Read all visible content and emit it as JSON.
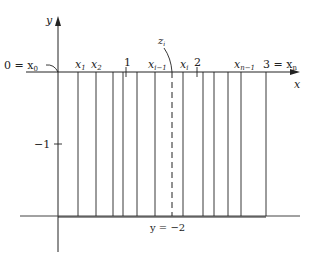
{
  "diagram": {
    "axes": {
      "x_label": "x",
      "y_label": "y"
    },
    "tick_labels": {
      "one": "1",
      "two": "2",
      "minus_one": "−1"
    },
    "partition_labels": {
      "x0": "0 = x",
      "x0_sub": "0",
      "x1": "x",
      "x1_sub": "1",
      "x2": "x",
      "x2_sub": "2",
      "xim1": "x",
      "xim1_sub": "i−1",
      "xi": "x",
      "xi_sub": "i",
      "xnm1": "x",
      "xnm1_sub": "n−1",
      "xn": "3 = x",
      "xn_sub": "n"
    },
    "sample_point": {
      "label": "z",
      "sub": "i"
    },
    "bottom_line_label": "y = −2",
    "partition_x_px": [
      58,
      78,
      96,
      113,
      123,
      137,
      155,
      183,
      203,
      214,
      228,
      241,
      266
    ],
    "sample_x_px": 172
  }
}
